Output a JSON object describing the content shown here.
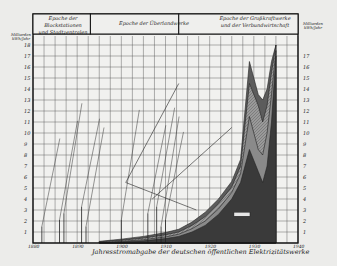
{
  "chart_data": {
    "type": "area",
    "title": "",
    "xlabel": "Jahresstromabgabe der deutschen öffentlichen Elektrizitätswerke",
    "ylabel_left": "Milliarden kWh/Jahr",
    "ylabel_right": "Milliarden kWh/Jahr",
    "x_ticks": [
      "1880",
      "1890",
      "1900",
      "1910",
      "1920",
      "1930",
      "1940"
    ],
    "y_ticks_left": [
      "1",
      "2",
      "3",
      "4",
      "5",
      "6",
      "7",
      "8",
      "9",
      "10",
      "11",
      "12",
      "13",
      "14",
      "15",
      "16",
      "17",
      "18"
    ],
    "y_ticks_right": [
      "1",
      "2",
      "3",
      "4",
      "5",
      "6",
      "7",
      "8",
      "9",
      "10",
      "11",
      "12",
      "13",
      "14",
      "15",
      "16",
      "17"
    ],
    "xlim": [
      1880,
      1940
    ],
    "ylim": [
      0,
      18
    ],
    "grid": true,
    "epochs": [
      {
        "label": "Epoche der Blockstationen und Stadtzentralen",
        "from": 1880,
        "to": 1893
      },
      {
        "label": "Epoche der Überlandwerke",
        "from": 1893,
        "to": 1913
      },
      {
        "label": "Epoche der Großkraftwerke und der Verbundwirtschaft",
        "from": 1913,
        "to": 1937
      }
    ],
    "x": [
      1895,
      1900,
      1905,
      1910,
      1913,
      1916,
      1919,
      1922,
      1925,
      1927,
      1929,
      1930,
      1931,
      1932,
      1933,
      1934,
      1935
    ],
    "series": [
      {
        "name": "Großkraftwerke",
        "fill": "#3a3a3a",
        "values": [
          0.0,
          0.1,
          0.2,
          0.4,
          0.6,
          1.0,
          1.6,
          2.6,
          4.0,
          5.5,
          8.5,
          7.5,
          6.5,
          5.5,
          7.0,
          11.0,
          17.0
        ]
      },
      {
        "name": "Mittlere Werke",
        "fill": "#8a8a8a",
        "values": [
          0.05,
          0.15,
          0.3,
          0.55,
          0.8,
          1.3,
          2.0,
          3.1,
          4.6,
          6.3,
          11.5,
          10.0,
          8.5,
          8.0,
          10.0,
          13.5,
          17.5
        ]
      },
      {
        "name": "Kleinere Werke",
        "fill": "#b5b5b5",
        "values": [
          0.1,
          0.25,
          0.45,
          0.75,
          1.0,
          1.6,
          2.4,
          3.6,
          5.1,
          7.0,
          14.5,
          13.5,
          12.5,
          11.0,
          12.5,
          15.5,
          18.0
        ]
      },
      {
        "name": "Gesamt",
        "fill": "#5c5c5c",
        "values": [
          0.15,
          0.35,
          0.6,
          0.95,
          1.25,
          1.9,
          2.8,
          4.0,
          5.6,
          7.6,
          16.5,
          15.0,
          13.5,
          13.0,
          14.0,
          16.5,
          18.0
        ]
      }
    ],
    "annotations": [
      "Erstes öffentliches Elektrizitätswerk",
      "Drehstromübertragung Lauffen–Frankfurt",
      "Erste Überlandzentrale",
      "Erste Großkraftwerke",
      "Verbundbetrieb",
      "Weltwirtschaftskrise",
      "Großkraftwerke"
    ],
    "annotation_markers": [
      1882,
      1886,
      1887,
      1891,
      1892,
      1900,
      1906,
      1908,
      1909,
      1910
    ]
  },
  "axis": {
    "unit_left_1": "Milliarden",
    "unit_left_2": "kWh/Jahr",
    "unit_right_1": "Milliarden",
    "unit_right_2": "kWh/Jahr"
  },
  "header": {
    "epoch_1_line1": "Epoche der Blockstationen",
    "epoch_1_line2": "und Stadtzentralen",
    "epoch_2": "Epoche der Überlandwerke",
    "epoch_3_line1": "Epoche der Großkraftwerke",
    "epoch_3_line2": "und der Verbundwirtschaft"
  },
  "inset_label": "Großkraftwerke"
}
